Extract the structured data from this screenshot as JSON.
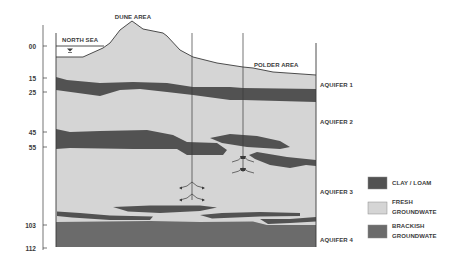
{
  "diagram": {
    "type": "hydrogeological cross-section",
    "place_labels": {
      "dune": "DUNE AREA",
      "sea": "NORTH SEA",
      "polder": "POLDER AREA"
    },
    "depth_axis": {
      "ticks": [
        "00",
        "15",
        "25",
        "45",
        "55",
        "103",
        "112"
      ]
    },
    "aquifers": [
      "AQUIFER 1",
      "AQUIFER 2",
      "AQUIFER 3",
      "AQUIFER 4"
    ],
    "wells": [
      {
        "name": "well-1",
        "screens": 2
      },
      {
        "name": "well-2",
        "screens": 2
      }
    ]
  },
  "colors": {
    "clay": "#525252",
    "fresh": "#d5d5d5",
    "brackish": "#6b6b6b",
    "line": "#3a3a3a"
  },
  "legend": {
    "items": [
      {
        "label_1": "CLAY / LOAM",
        "label_2": "",
        "color": "#525252"
      },
      {
        "label_1": "FRESH",
        "label_2": "GROUNDWATE",
        "color": "#d5d5d5"
      },
      {
        "label_1": "BRACKISH",
        "label_2": "GROUNDWATE",
        "color": "#6b6b6b"
      }
    ]
  }
}
